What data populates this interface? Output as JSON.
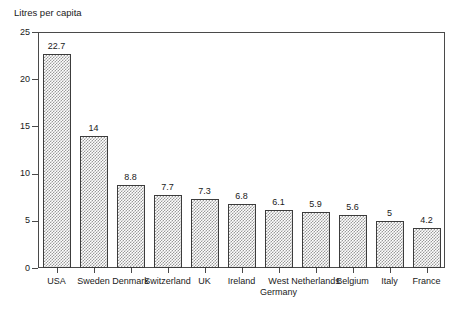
{
  "chart_data": {
    "type": "bar",
    "title": "Litres per capita",
    "xlabel": "",
    "ylabel": "Litres per capita",
    "categories": [
      "USA",
      "Sweden",
      "Denmark",
      "Switzerland",
      "UK",
      "Ireland",
      "West Germany",
      "Netherlands",
      "Belgium",
      "Italy",
      "France"
    ],
    "category_lines": [
      [
        "USA"
      ],
      [
        "Sweden"
      ],
      [
        "Denmark"
      ],
      [
        "Switzerland"
      ],
      [
        "UK"
      ],
      [
        "Ireland"
      ],
      [
        "West",
        "Germany"
      ],
      [
        "Netherlands"
      ],
      [
        "Belgium"
      ],
      [
        "Italy"
      ],
      [
        "France"
      ]
    ],
    "values": [
      22.7,
      14,
      8.8,
      7.7,
      7.3,
      6.8,
      6.1,
      5.9,
      5.6,
      5,
      4.2
    ],
    "value_labels": [
      "22.7",
      "14",
      "8.8",
      "7.7",
      "7.3",
      "6.8",
      "6.1",
      "5.9",
      "5.6",
      "5",
      "4.2"
    ],
    "ylim": [
      0,
      25
    ],
    "yticks": [
      0,
      5,
      10,
      15,
      20,
      25
    ],
    "ytick_labels": [
      "0",
      "5",
      "10",
      "15",
      "20",
      "25"
    ],
    "grid": false,
    "legend": false,
    "legend_position": "none",
    "bar_fill": "#9a9a9a",
    "bar_edge": "#3c3c3c",
    "axis_color": "#4a4a4a",
    "background": "#ffffff",
    "text_color": "#1a1a1a"
  }
}
